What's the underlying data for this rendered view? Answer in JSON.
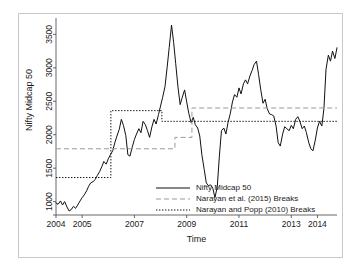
{
  "chart_data": {
    "type": "line",
    "title": "",
    "xlabel": "Time",
    "ylabel": "Nifty Midcap 50",
    "xlim": [
      2004.0,
      2014.75
    ],
    "ylim": [
      800,
      3700
    ],
    "xticks": [
      2004,
      2005,
      2007,
      2009,
      2011,
      2013,
      2014
    ],
    "xtick_labels": [
      "2004",
      "2005",
      "2007",
      "2009",
      "2011",
      "2013",
      "2014"
    ],
    "yticks": [
      1000,
      1500,
      2000,
      2500,
      3000,
      3500
    ],
    "ytick_labels": [
      "1000",
      "1500",
      "2000",
      "2500",
      "3000",
      "3500"
    ],
    "grid": false,
    "legend_position": "bottom-center",
    "series": [
      {
        "name": "Nifty Midcap 50",
        "style": "solid",
        "color": "#111111",
        "x": [
          2004.0,
          2004.08,
          2004.17,
          2004.25,
          2004.33,
          2004.42,
          2004.5,
          2004.58,
          2004.67,
          2004.75,
          2004.83,
          2004.92,
          2005.0,
          2005.08,
          2005.17,
          2005.25,
          2005.33,
          2005.42,
          2005.5,
          2005.58,
          2005.67,
          2005.75,
          2005.83,
          2005.92,
          2006.0,
          2006.08,
          2006.17,
          2006.25,
          2006.33,
          2006.42,
          2006.5,
          2006.58,
          2006.67,
          2006.75,
          2006.83,
          2006.92,
          2007.0,
          2007.08,
          2007.17,
          2007.25,
          2007.33,
          2007.42,
          2007.5,
          2007.58,
          2007.67,
          2007.75,
          2007.83,
          2007.92,
          2008.0,
          2008.08,
          2008.17,
          2008.25,
          2008.33,
          2008.42,
          2008.5,
          2008.58,
          2008.67,
          2008.75,
          2008.83,
          2008.92,
          2009.0,
          2009.08,
          2009.17,
          2009.25,
          2009.33,
          2009.42,
          2009.5,
          2009.58,
          2009.67,
          2009.75,
          2009.83,
          2009.92,
          2010.0,
          2010.08,
          2010.17,
          2010.25,
          2010.33,
          2010.42,
          2010.5,
          2010.58,
          2010.67,
          2010.75,
          2010.83,
          2010.92,
          2011.0,
          2011.08,
          2011.17,
          2011.25,
          2011.33,
          2011.42,
          2011.5,
          2011.58,
          2011.67,
          2011.75,
          2011.83,
          2011.92,
          2012.0,
          2012.08,
          2012.17,
          2012.25,
          2012.33,
          2012.42,
          2012.5,
          2012.58,
          2012.67,
          2012.75,
          2012.83,
          2012.92,
          2013.0,
          2013.08,
          2013.17,
          2013.25,
          2013.33,
          2013.42,
          2013.5,
          2013.58,
          2013.67,
          2013.75,
          2013.83,
          2013.92,
          2014.0,
          2014.08,
          2014.17,
          2014.25,
          2014.33,
          2014.42,
          2014.5,
          2014.58,
          2014.67,
          2014.75
        ],
        "y": [
          980,
          960,
          1010,
          950,
          1000,
          920,
          860,
          880,
          930,
          900,
          950,
          1010,
          1060,
          1100,
          1160,
          1230,
          1280,
          1300,
          1330,
          1390,
          1450,
          1520,
          1600,
          1560,
          1640,
          1700,
          1760,
          1880,
          1980,
          2080,
          2230,
          2140,
          1990,
          1700,
          1680,
          1820,
          1930,
          2010,
          2090,
          2030,
          2200,
          2150,
          2060,
          1960,
          2120,
          2230,
          2160,
          2300,
          2430,
          2560,
          2720,
          3000,
          3300,
          3640,
          3380,
          3060,
          2700,
          2450,
          2560,
          2670,
          2490,
          2320,
          2180,
          2260,
          2150,
          2100,
          1980,
          1700,
          1480,
          1280,
          1240,
          1250,
          1200,
          1060,
          1220,
          1680,
          2060,
          2100,
          2010,
          2180,
          2320,
          2490,
          2600,
          2560,
          2700,
          2610,
          2760,
          2820,
          2760,
          2880,
          2960,
          3050,
          3100,
          2900,
          2680,
          2470,
          2530,
          2390,
          2310,
          2300,
          2280,
          2130,
          1880,
          1830,
          2010,
          2120,
          2090,
          2060,
          2140,
          2090,
          2230,
          2270,
          2200,
          2090,
          2130,
          2030,
          1880,
          1790,
          1760,
          1920,
          2100,
          2200,
          2130,
          2390,
          2980,
          3190,
          3100,
          3250,
          3140,
          3300
        ]
      },
      {
        "name": "Narayan et al. (2015) Breaks",
        "style": "dashed",
        "color": "#9a9a9a",
        "segments": [
          {
            "x_start": 2004.0,
            "x_end": 2008.55,
            "level": 1790
          },
          {
            "x_start": 2008.55,
            "x_end": 2009.2,
            "level": 1960
          },
          {
            "x_start": 2009.2,
            "x_end": 2014.75,
            "level": 2400
          }
        ]
      },
      {
        "name": "Narayan and Popp (2010) Breaks",
        "style": "dotted",
        "color": "#111111",
        "segments": [
          {
            "x_start": 2004.0,
            "x_end": 2006.1,
            "level": 1360
          },
          {
            "x_start": 2006.1,
            "x_end": 2008.05,
            "level": 2360
          },
          {
            "x_start": 2008.05,
            "x_end": 2014.75,
            "level": 2200
          }
        ]
      }
    ],
    "legend": [
      {
        "label": "Nifty Midcap 50",
        "style": "solid",
        "color": "#111111"
      },
      {
        "label": "Narayan et al. (2015) Breaks",
        "style": "dashed",
        "color": "#9a9a9a"
      },
      {
        "label": "Narayan and Popp (2010) Breaks",
        "style": "dotted",
        "color": "#111111"
      }
    ]
  }
}
